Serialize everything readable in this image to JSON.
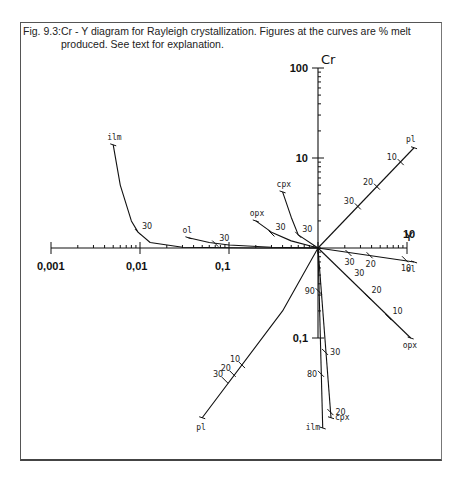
{
  "caption": {
    "figure_number": "Fig. 9.3:",
    "text": "Cr - Y diagram for Rayleigh crystallization. Figures at the curves are % melt produced. See text for explanation."
  },
  "chart_data": {
    "type": "line",
    "title": "Cr - Y diagram for Rayleigh crystallization",
    "xlabel": "Y",
    "ylabel": "Cr",
    "x_scale": "log",
    "y_scale": "log",
    "xlim": [
      0.001,
      10
    ],
    "ylim": [
      0.1,
      100
    ],
    "x_tick_labels": [
      "0,001",
      "0,01",
      "0,1",
      "10"
    ],
    "y_tick_labels": [
      "0,1",
      "10",
      "100"
    ],
    "grid": false,
    "legend": "none",
    "note": "Figures at the curves are % melt produced",
    "series": [
      {
        "name": "ilm",
        "curve": "upper-left",
        "points": [
          [
            0.005,
            14
          ],
          [
            0.006,
            5
          ],
          [
            0.008,
            2
          ],
          [
            0.0095,
            1.5
          ],
          [
            0.013,
            1.15
          ],
          [
            0.03,
            1.02
          ],
          [
            0.2,
            1.0
          ],
          [
            1,
            1
          ]
        ],
        "marks": [
          {
            "label": "30",
            "x": 0.0095,
            "y": 1.5
          }
        ]
      },
      {
        "name": "ol",
        "curve": "upper-left",
        "points": [
          [
            0.035,
            1.3
          ],
          [
            0.06,
            1.15
          ],
          [
            0.1,
            1.08
          ],
          [
            0.3,
            1.02
          ],
          [
            1,
            1
          ]
        ],
        "marks": [
          {
            "label": "30",
            "x": 0.07,
            "y": 1.12
          }
        ]
      },
      {
        "name": "opx",
        "curve": "upper-left",
        "points": [
          [
            0.2,
            2.0
          ],
          [
            0.3,
            1.5
          ],
          [
            0.5,
            1.2
          ],
          [
            1,
            1
          ]
        ],
        "marks": [
          {
            "label": "30",
            "x": 0.3,
            "y": 1.45
          }
        ]
      },
      {
        "name": "cpx",
        "curve": "upper-left",
        "points": [
          [
            0.4,
            4.2
          ],
          [
            0.5,
            2.2
          ],
          [
            0.6,
            1.4
          ],
          [
            1,
            1
          ]
        ],
        "marks": [
          {
            "label": "30",
            "x": 0.6,
            "y": 1.4
          }
        ]
      },
      {
        "name": "pl",
        "curve": "upper-right",
        "points": [
          [
            1,
            1
          ],
          [
            12,
            13
          ]
        ],
        "marks": [
          {
            "label": "30",
            "x": 2.8,
            "y": 2.9
          },
          {
            "label": "20",
            "x": 4.6,
            "y": 4.8
          },
          {
            "label": "10",
            "x": 8.5,
            "y": 9
          }
        ]
      },
      {
        "name": "ol",
        "curve": "lower-right",
        "points": [
          [
            1,
            1
          ],
          [
            12,
            0.7
          ]
        ],
        "marks": [
          {
            "label": "30",
            "x": 2.2,
            "y": 0.88
          },
          {
            "label": "20",
            "x": 3.8,
            "y": 0.83
          },
          {
            "label": "10",
            "x": 9.5,
            "y": 0.75
          }
        ]
      },
      {
        "name": "opx",
        "curve": "lower-right",
        "points": [
          [
            1,
            1
          ],
          [
            11,
            0.1
          ]
        ],
        "marks": [
          {
            "label": "30",
            "x": 2.3,
            "y": 0.45
          },
          {
            "label": "20",
            "x": 3.6,
            "y": 0.29
          },
          {
            "label": "10",
            "x": 6.2,
            "y": 0.17
          }
        ]
      },
      {
        "name": "cpx",
        "curve": "lower",
        "points": [
          [
            1,
            1
          ],
          [
            1.4,
            0.013
          ]
        ],
        "marks": [
          {
            "label": "30",
            "x": 1.2,
            "y": 0.07
          },
          {
            "label": "20",
            "x": 1.38,
            "y": 0.015
          }
        ]
      },
      {
        "name": "ilm",
        "curve": "lower",
        "points": [
          [
            1,
            1
          ],
          [
            1.13,
            0.01
          ]
        ],
        "marks": [
          {
            "label": "90",
            "x": 1.02,
            "y": 0.33
          },
          {
            "label": "80",
            "x": 1.08,
            "y": 0.04
          }
        ]
      },
      {
        "name": "pl",
        "curve": "lower-left",
        "points": [
          [
            1,
            1
          ],
          [
            0.4,
            0.2
          ],
          [
            0.05,
            0.013
          ]
        ],
        "marks": [
          {
            "label": "10",
            "x": 0.14,
            "y": 0.05
          },
          {
            "label": "20",
            "x": 0.11,
            "y": 0.04
          },
          {
            "label": "30",
            "x": 0.09,
            "y": 0.034
          }
        ]
      }
    ]
  }
}
